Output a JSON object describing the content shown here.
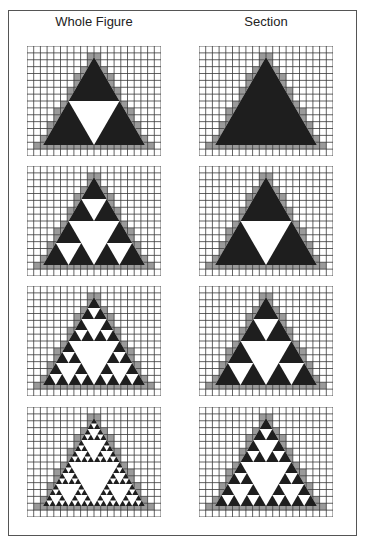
{
  "columns": [
    {
      "title": "Whole Figure",
      "x": 27
    },
    {
      "title": "Section",
      "x": 199
    }
  ],
  "rows_top": [
    46,
    166,
    286,
    407
  ],
  "grid": {
    "cols": 20,
    "rows": 16,
    "width": 134,
    "height": 110
  },
  "triangle": {
    "apex_col": 10,
    "apex_row": 1.6,
    "base_row": 14.4,
    "half_base_cols": 7.6
  },
  "colors": {
    "grid": "#3a3a3a",
    "fill": "#1e1e1e",
    "edge": "#9a9a9a",
    "background": "#ffffff",
    "border": "#555555"
  },
  "panels": [
    {
      "row": 0,
      "column": "Whole Figure",
      "depth": 1
    },
    {
      "row": 0,
      "column": "Section",
      "depth": 0
    },
    {
      "row": 1,
      "column": "Whole Figure",
      "depth": 2
    },
    {
      "row": 1,
      "column": "Section",
      "depth": 1
    },
    {
      "row": 2,
      "column": "Whole Figure",
      "depth": 3
    },
    {
      "row": 2,
      "column": "Section",
      "depth": 2
    },
    {
      "row": 3,
      "column": "Whole Figure",
      "depth": 4
    },
    {
      "row": 3,
      "column": "Section",
      "depth": 3
    }
  ]
}
